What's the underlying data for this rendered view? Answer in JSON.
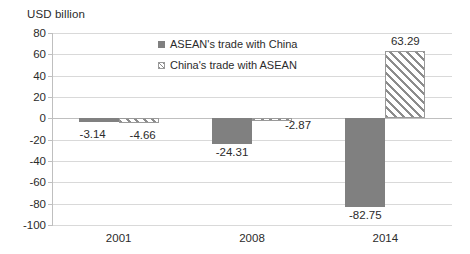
{
  "chart_data": {
    "type": "bar",
    "title": "USD billion",
    "xlabel": "",
    "ylabel": "USD billion",
    "categories": [
      "2001",
      "2008",
      "2014"
    ],
    "series": [
      {
        "name": "ASEAN's trade with China",
        "style": "solid-gray",
        "color": "#808080",
        "values": [
          -3.14,
          -24.31,
          -82.75
        ],
        "labels": [
          "-3.14",
          "-24.31",
          "-82.75"
        ]
      },
      {
        "name": "China's trade with ASEAN",
        "style": "diagonal-hatch",
        "color": "#8c8c8c",
        "values": [
          -4.66,
          -2.87,
          63.29
        ],
        "labels": [
          "-4.66",
          "-2.87",
          "63.29"
        ]
      }
    ],
    "ylim": [
      -100,
      80
    ],
    "ytick_step": 20,
    "yticks": [
      80,
      60,
      40,
      20,
      0,
      -20,
      -40,
      -60,
      -80,
      -100
    ],
    "ytick_labels": [
      "80",
      "60",
      "40",
      "20",
      "0",
      "-20",
      "-40",
      "-60",
      "-80",
      "-100"
    ],
    "grid": true,
    "grid_axis": "y",
    "legend_position": "inside-top-center",
    "background": "#ffffff"
  },
  "legend": {
    "items": [
      {
        "label": "ASEAN's trade with China",
        "swatch": "solid-gray"
      },
      {
        "label": "China's trade with ASEAN",
        "swatch": "diagonal-hatch"
      }
    ]
  }
}
